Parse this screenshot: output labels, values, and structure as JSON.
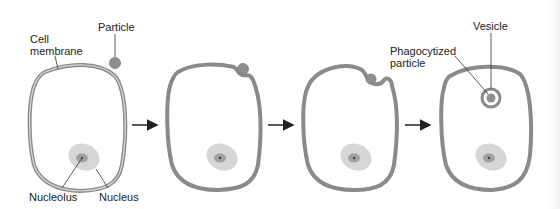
{
  "diagram": {
    "stages": [
      {
        "id": 1,
        "description": "Particle approaches cell"
      },
      {
        "id": 2,
        "description": "Membrane contacts particle"
      },
      {
        "id": 3,
        "description": "Membrane engulfs particle"
      },
      {
        "id": 4,
        "description": "Particle enclosed in vesicle"
      }
    ],
    "labels": {
      "cell_membrane": "Cell\nmembrane",
      "particle": "Particle",
      "nucleolus": "Nucleolus",
      "nucleus": "Nucleus",
      "phagocytized_particle": "Phagocytized\nparticle",
      "vesicle": "Vesicle"
    },
    "colors": {
      "membrane": "#8a8a8a",
      "membrane_inner": "#c8c8c8",
      "particle": "#8f8f8f",
      "nucleus": "#d4d4d4",
      "nucleolus": "#9a9a9a",
      "arrow": "#222222",
      "leader": "#333333"
    }
  }
}
